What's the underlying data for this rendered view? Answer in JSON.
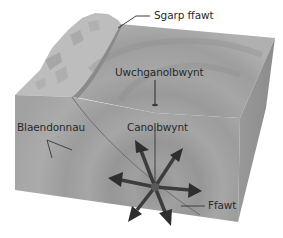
{
  "diagram": {
    "type": "earthquake-fault-block",
    "labels": {
      "fault_scarp": "Sgarp ffawt",
      "epicentre": "Uwchganolbwynt",
      "wavefronts": "Blaendonnau",
      "focus": "Canolbwynt",
      "fault": "Ffawt"
    },
    "colors": {
      "top_surface": "#a9a9a9",
      "front_face": "#9d9d9d",
      "side_face": "#8a8a8a",
      "scarp": "#b8b8b8",
      "arrows": "#3a3a3a",
      "leader_lines": "#2a2a2a",
      "focus_dot": "#555555"
    },
    "arrows": {
      "count": 7,
      "directions": [
        "up-left",
        "up-right",
        "left",
        "right",
        "down-left",
        "down-right"
      ]
    }
  }
}
